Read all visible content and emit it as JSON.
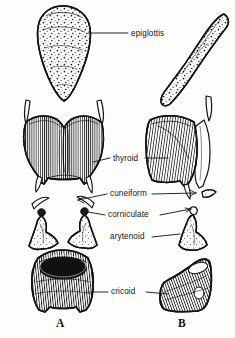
{
  "figure": {
    "background_color": "#fdfdfb",
    "ink_color": "#111111",
    "width": 235,
    "height": 338
  },
  "labels": [
    {
      "id": "epiglottis",
      "text": "epiglottis",
      "x": 131,
      "y": 36
    },
    {
      "id": "thyroid",
      "text": "thyroid",
      "x": 113,
      "y": 161
    },
    {
      "id": "cuneiform",
      "text": "cuneiform",
      "x": 110,
      "y": 197
    },
    {
      "id": "corniculate",
      "text": "corniculate",
      "x": 108,
      "y": 218
    },
    {
      "id": "arytenoid",
      "text": "arytenoid",
      "x": 110,
      "y": 240
    },
    {
      "id": "cricoid",
      "text": "cricoid",
      "x": 111,
      "y": 295
    }
  ],
  "panels": [
    {
      "id": "A",
      "text": "A",
      "x": 56,
      "y": 320
    },
    {
      "id": "B",
      "text": "B",
      "x": 178,
      "y": 320
    }
  ],
  "structures": {
    "panel_a": [
      "epiglottis",
      "thyroid-cartilage",
      "cuneiform-cartilage-left",
      "cuneiform-cartilage-right",
      "corniculate-cartilage-left",
      "corniculate-cartilage-right",
      "arytenoid-cartilage-left",
      "arytenoid-cartilage-right",
      "cricoid-cartilage"
    ],
    "panel_b": [
      "epiglottis",
      "thyroid-cartilage",
      "cuneiform-cartilage",
      "corniculate-cartilage",
      "arytenoid-cartilage",
      "cricoid-cartilage"
    ]
  }
}
